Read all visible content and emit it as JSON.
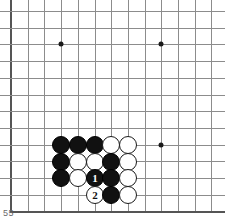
{
  "diagram": {
    "type": "go-board-diagram",
    "caption": "55",
    "board": {
      "origin_x": 11,
      "origin_y": 11,
      "spacing": 16.7,
      "columns": 13,
      "rows": 12,
      "left_edge_is_border": true,
      "bottom_edge_is_border": true,
      "line_color": "#8c8c8c",
      "edge_color": "#555555",
      "background_color": "#ffffff"
    },
    "star_points": [
      {
        "x": 61,
        "y": 44
      },
      {
        "x": 161,
        "y": 44
      },
      {
        "x": 161,
        "y": 145
      }
    ],
    "stones": [
      {
        "x": 61,
        "y": 145,
        "color": "black",
        "label": ""
      },
      {
        "x": 78,
        "y": 145,
        "color": "black",
        "label": ""
      },
      {
        "x": 95,
        "y": 145,
        "color": "black",
        "label": ""
      },
      {
        "x": 111,
        "y": 145,
        "color": "white",
        "label": ""
      },
      {
        "x": 128,
        "y": 145,
        "color": "white",
        "label": ""
      },
      {
        "x": 61,
        "y": 162,
        "color": "black",
        "label": ""
      },
      {
        "x": 78,
        "y": 162,
        "color": "white",
        "label": ""
      },
      {
        "x": 95,
        "y": 162,
        "color": "white",
        "label": ""
      },
      {
        "x": 111,
        "y": 162,
        "color": "black",
        "label": ""
      },
      {
        "x": 128,
        "y": 162,
        "color": "white",
        "label": ""
      },
      {
        "x": 61,
        "y": 178,
        "color": "black",
        "label": ""
      },
      {
        "x": 78,
        "y": 178,
        "color": "white",
        "label": ""
      },
      {
        "x": 95,
        "y": 178,
        "color": "black",
        "label": "1"
      },
      {
        "x": 111,
        "y": 178,
        "color": "black",
        "label": ""
      },
      {
        "x": 128,
        "y": 178,
        "color": "white",
        "label": ""
      },
      {
        "x": 95,
        "y": 195,
        "color": "white",
        "label": "2"
      },
      {
        "x": 111,
        "y": 195,
        "color": "black",
        "label": ""
      },
      {
        "x": 128,
        "y": 195,
        "color": "white",
        "label": ""
      }
    ],
    "moves": [
      {
        "number": "1",
        "color": "black"
      },
      {
        "number": "2",
        "color": "white"
      }
    ]
  }
}
